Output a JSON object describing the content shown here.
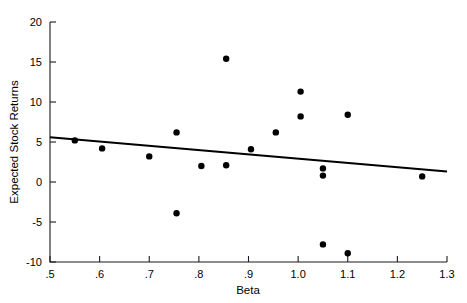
{
  "chart_data": {
    "type": "scatter",
    "title": "",
    "xlabel": "Beta",
    "ylabel": "Expected Stock Returns",
    "xlim": [
      0.5,
      1.3
    ],
    "ylim": [
      -10,
      20
    ],
    "grid": false,
    "legend": "none",
    "xticks": [
      0.5,
      0.6,
      0.7,
      0.8,
      0.9,
      1.0,
      1.1,
      1.2,
      1.3
    ],
    "xtick_labels": [
      ".5",
      ".6",
      ".7",
      ".8",
      ".9",
      "1.0",
      "1.1",
      "1.2",
      "1.3"
    ],
    "yticks": [
      -10,
      -5,
      0,
      5,
      10,
      15,
      20
    ],
    "ytick_labels": [
      "-10",
      "-5",
      "0",
      "5",
      "10",
      "15",
      "20"
    ],
    "points": [
      {
        "x": 0.55,
        "y": 5.2
      },
      {
        "x": 0.605,
        "y": 4.2
      },
      {
        "x": 0.7,
        "y": 3.2
      },
      {
        "x": 0.755,
        "y": 6.2
      },
      {
        "x": 0.755,
        "y": -3.9
      },
      {
        "x": 0.805,
        "y": 2.0
      },
      {
        "x": 0.855,
        "y": 15.4
      },
      {
        "x": 0.855,
        "y": 2.1
      },
      {
        "x": 0.905,
        "y": 4.1
      },
      {
        "x": 0.955,
        "y": 6.2
      },
      {
        "x": 1.005,
        "y": 11.3
      },
      {
        "x": 1.005,
        "y": 8.2
      },
      {
        "x": 1.05,
        "y": 1.7
      },
      {
        "x": 1.05,
        "y": 0.8
      },
      {
        "x": 1.05,
        "y": -7.8
      },
      {
        "x": 1.1,
        "y": 8.4
      },
      {
        "x": 1.1,
        "y": -8.9
      },
      {
        "x": 1.25,
        "y": 0.7
      }
    ],
    "trend_line": {
      "x_start": 0.5,
      "y_start": 5.6,
      "x_end": 1.3,
      "y_end": 1.3
    },
    "marker_color": "#000000",
    "line_color": "#000000",
    "axis_color": "#1a1a1a",
    "background_color": "#ffffff"
  }
}
